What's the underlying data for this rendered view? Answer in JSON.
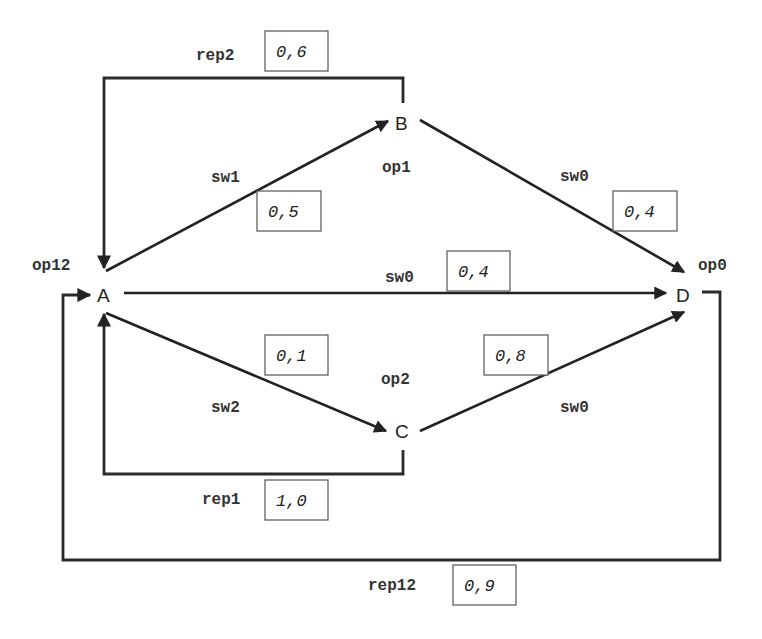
{
  "diagram": {
    "type": "state-transition-graph",
    "nodes": [
      {
        "id": "A",
        "label": "A",
        "op_label": "op12"
      },
      {
        "id": "B",
        "label": "B",
        "op_label": "op1"
      },
      {
        "id": "C",
        "label": "C",
        "op_label": "op2"
      },
      {
        "id": "D",
        "label": "D",
        "op_label": "op0"
      }
    ],
    "edges": [
      {
        "from": "A",
        "to": "B",
        "label": "sw1",
        "prob": "0,5"
      },
      {
        "from": "B",
        "to": "D",
        "label": "sw0",
        "prob": "0,4"
      },
      {
        "from": "A",
        "to": "D",
        "label": "sw0",
        "prob": "0,4"
      },
      {
        "from": "A",
        "to": "C",
        "label": "sw2",
        "prob": "0,1"
      },
      {
        "from": "C",
        "to": "D",
        "label": "sw0",
        "prob": "0,8"
      },
      {
        "from": "B",
        "to": "A",
        "label": "rep2",
        "prob": "0,6"
      },
      {
        "from": "C",
        "to": "A",
        "label": "rep1",
        "prob": "1,0"
      },
      {
        "from": "D",
        "to": "A",
        "label": "rep12",
        "prob": "0,9"
      }
    ]
  }
}
